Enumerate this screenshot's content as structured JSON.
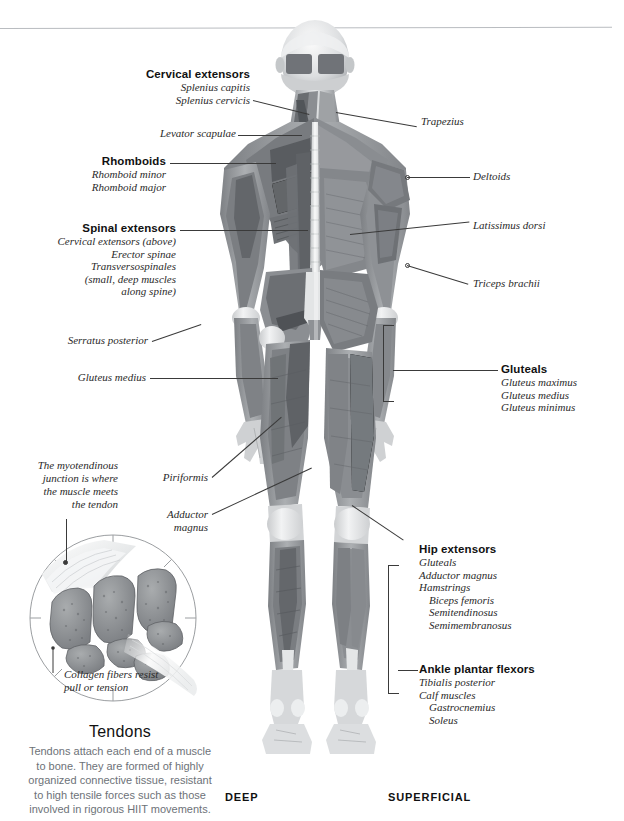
{
  "figure": {
    "title_hidden": "",
    "view": "posterior full-body muscular anatomy",
    "split": {
      "left_label": "DEEP",
      "right_label": "SUPERFICIAL"
    }
  },
  "bottom_keys": {
    "deep": "DEEP",
    "superficial": "SUPERFICIAL"
  },
  "labels_left": [
    {
      "id": "cervical-extensors",
      "head": "Cervical extensors",
      "items": [
        "Splenius capitis",
        "Splenius cervicis"
      ]
    },
    {
      "id": "levator-scapulae",
      "head": "",
      "items": [
        "Levator scapulae"
      ]
    },
    {
      "id": "rhomboids",
      "head": "Rhomboids",
      "items": [
        "Rhomboid minor",
        "Rhomboid major"
      ]
    },
    {
      "id": "spinal-extensors",
      "head": "Spinal extensors",
      "items": [
        "Cervical extensors (above)",
        "Erector spinae",
        "Transversospinales",
        "(small, deep muscles",
        "along spine)"
      ]
    },
    {
      "id": "serratus-posterior",
      "head": "",
      "items": [
        "Serratus posterior"
      ]
    },
    {
      "id": "gluteus-medius",
      "head": "",
      "items": [
        "Gluteus medius"
      ]
    },
    {
      "id": "piriformis",
      "head": "",
      "items": [
        "Piriformis"
      ]
    },
    {
      "id": "adductor-magnus",
      "head": "",
      "items": [
        "Adductor",
        "magnus"
      ]
    }
  ],
  "labels_right": [
    {
      "id": "trapezius",
      "head": "",
      "items": [
        "Trapezius"
      ]
    },
    {
      "id": "deltoids",
      "head": "",
      "items": [
        "Deltoids"
      ]
    },
    {
      "id": "latissimus-dorsi",
      "head": "",
      "items": [
        "Latissimus dorsi"
      ]
    },
    {
      "id": "triceps-brachii",
      "head": "",
      "items": [
        "Triceps brachii"
      ]
    },
    {
      "id": "gluteals",
      "head": "Gluteals",
      "items": [
        "Gluteus maximus",
        "Gluteus medius",
        "Gluteus minimus"
      ]
    },
    {
      "id": "hip-extensors",
      "head": "Hip extensors",
      "items": [
        "Gluteals",
        "Adductor magnus",
        "Hamstrings"
      ],
      "subitems": [
        "Biceps femoris",
        "Semitendinosus",
        "Semimembranosus"
      ]
    },
    {
      "id": "ankle-plantar-flexors",
      "head": "Ankle plantar flexors",
      "items": [
        "Tibialis posterior",
        "Calf muscles"
      ],
      "subitems": [
        "Gastrocnemius",
        "Soleus"
      ]
    }
  ],
  "annotations": {
    "myotendinous": [
      "The myotendinous",
      "junction is where",
      "the muscle meets",
      "the tendon"
    ],
    "collagen": [
      "Collagen fibers resist",
      "pull or tension"
    ]
  },
  "tendons_panel": {
    "title": "Tendons",
    "body": [
      "Tendons attach each end of a muscle",
      "to bone. They are formed of highly",
      "organized connective tissue, resistant",
      "to high tensile forces such as those",
      "involved in rigorous HIIT movements."
    ]
  },
  "colors": {
    "rule": "#b9bcc0",
    "leader": "#3a3a3a",
    "text": "#1b1b1b",
    "muted_text": "#6d7278",
    "muscle_dark": "#6f7276",
    "muscle_mid": "#9a9ea2",
    "muscle_light": "#d7d9db",
    "bone": "#eceeef",
    "tendon_fill": "#8e9296"
  }
}
